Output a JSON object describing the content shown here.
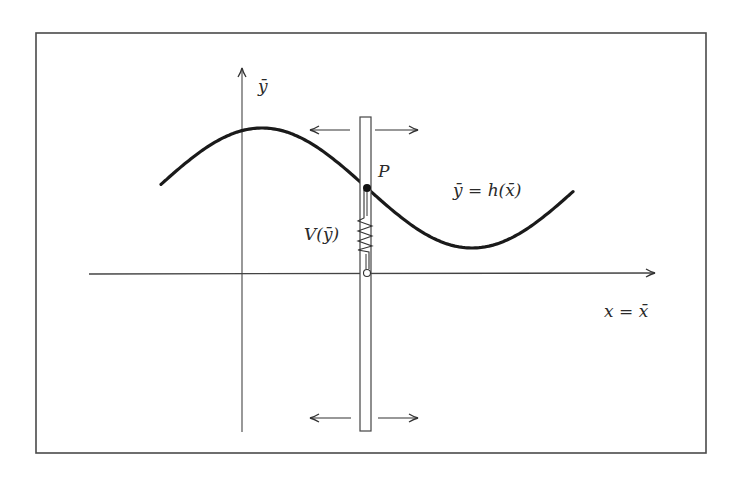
{
  "diagram": {
    "frame": {
      "x": 36,
      "y": 33,
      "width": 670,
      "height": 420,
      "stroke": "#4a4a4a"
    },
    "axes": {
      "x_axis": {
        "x1": 89,
        "y": 274,
        "x2": 655,
        "label": "x = x̄",
        "label_pos": {
          "x": 604,
          "y": 317
        }
      },
      "y_axis": {
        "x": 242,
        "y1": 432,
        "y2": 68,
        "label": "ȳ",
        "label_pos": {
          "x": 258,
          "y": 92
        }
      }
    },
    "curve": {
      "label": "ȳ = h(x̄)",
      "label_pos": {
        "x": 453,
        "y": 196
      },
      "shape": "sine",
      "start": {
        "x": 161,
        "y": 188
      },
      "peak": {
        "x": 262,
        "y": 128
      },
      "inflection_P": {
        "x": 367,
        "y": 188
      },
      "trough": {
        "x": 472,
        "y": 248
      },
      "end": {
        "x": 574,
        "y": 187
      },
      "stroke": "#1a1a1a",
      "stroke_width": 3.2
    },
    "point_P": {
      "label": "P",
      "x": 367,
      "y": 188,
      "label_pos": {
        "x": 378,
        "y": 177
      }
    },
    "slider_bar": {
      "x": 360,
      "y": 117,
      "width": 11,
      "height": 314
    },
    "spring": {
      "label": "V(ȳ)",
      "label_pos": {
        "x": 304,
        "y": 240
      },
      "top_y": 218,
      "bottom_y": 252
    },
    "anchor_circle": {
      "x": 367,
      "y": 273,
      "r": 3.5
    },
    "arrows": {
      "top_left": {
        "x1": 350,
        "x2": 310,
        "y": 130
      },
      "top_right": {
        "x1": 375,
        "x2": 418,
        "y": 130
      },
      "bottom_left": {
        "x1": 351,
        "x2": 310,
        "y": 418
      },
      "bottom_right": {
        "x1": 378,
        "x2": 418,
        "y": 418
      }
    },
    "colors": {
      "line": "#333333",
      "curve": "#1a1a1a",
      "text": "#2a2a2a",
      "background": "#ffffff"
    }
  }
}
